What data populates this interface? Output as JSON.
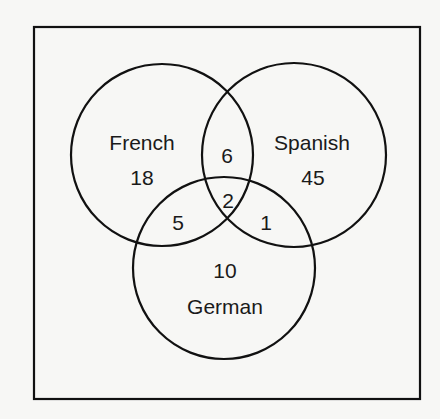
{
  "diagram": {
    "type": "venn",
    "sets": [
      {
        "name": "French",
        "only": 18
      },
      {
        "name": "Spanish",
        "only": 45
      },
      {
        "name": "German",
        "only": 10
      }
    ],
    "intersections": {
      "french_spanish": 6,
      "french_german": 5,
      "spanish_german": 1,
      "french_spanish_german": 2
    },
    "labels": {
      "french": "French",
      "french_only": "18",
      "spanish": "Spanish",
      "spanish_only": "45",
      "german": "German",
      "german_only": "10",
      "french_spanish": "6",
      "french_german": "5",
      "spanish_german": "1",
      "all_three": "2"
    },
    "colors": {
      "stroke": "#111111",
      "background": "#f7f7f5",
      "text": "#1a1a1a"
    }
  }
}
